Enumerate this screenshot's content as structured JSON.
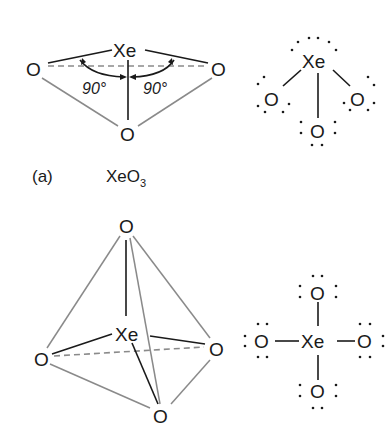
{
  "figure": {
    "panel_a": {
      "label": "(a)",
      "formula_main": "XeO",
      "formula_sub": "3",
      "structure_3d": {
        "center_atom": "Xe",
        "ligands": [
          "O",
          "O",
          "O"
        ],
        "angle_labels": [
          "90°",
          "90°"
        ]
      },
      "lewis": {
        "center_atom": "Xe",
        "ligands": [
          "O",
          "O",
          "O"
        ]
      }
    },
    "panel_b": {
      "structure_3d": {
        "center_atom": "Xe",
        "ligands": [
          "O",
          "O",
          "O",
          "O"
        ]
      },
      "lewis": {
        "center_atom": "Xe",
        "ligands": [
          "O",
          "O",
          "O",
          "O"
        ]
      }
    }
  },
  "colors": {
    "ink": "#1a1a1a",
    "edge_gray": "#8a8a8a",
    "background": "#ffffff"
  }
}
